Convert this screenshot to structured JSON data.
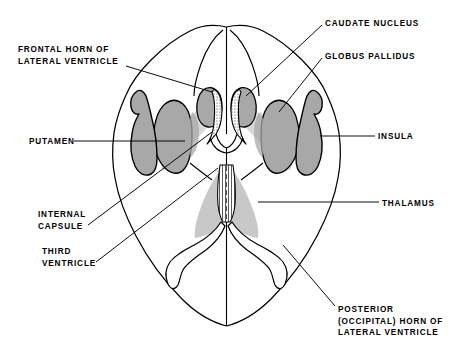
{
  "figure": {
    "type": "anatomical-diagram",
    "orientation": "anterior at top, posterior at bottom",
    "line_color": "#000000",
    "background_color": "#ffffff"
  },
  "labels": {
    "frontal_horn": "FRONTAL HORN OF\nLATERAL VENTRICLE",
    "caudate_nucleus": "CAUDATE NUCLEUS",
    "globus_pallidus": "GLOBUS PALLIDUS",
    "putamen": "PUTAMEN",
    "insula": "INSULA",
    "internal_capsule": "INTERNAL\nCAPSULE",
    "thalamus": "THALAMUS",
    "third_ventricle": "THIRD\nVENTRICLE",
    "posterior_horn": "POSTERIOR\n(OCCIPITAL) HORN OF\nLATERAL VENTRICLE"
  },
  "structures": [
    {
      "name": "cerebral-outline",
      "fill": "#ffffff",
      "stroke": "#000000"
    },
    {
      "name": "insula",
      "fill": "#a8a8a8",
      "stroke": "#000000"
    },
    {
      "name": "putamen",
      "fill": "#a8a8a8",
      "stroke": "#000000"
    },
    {
      "name": "caudate-nucleus",
      "fill": "#a8a8a8",
      "stroke": "#000000"
    },
    {
      "name": "globus-pallidus",
      "fill": "#a8a8a8",
      "stroke": "#000000"
    },
    {
      "name": "internal-capsule",
      "fill": "#d8d8d8",
      "stroke": "none"
    },
    {
      "name": "thalamus",
      "fill": "#c8c8c8",
      "stroke": "none"
    },
    {
      "name": "frontal-horn",
      "fill": "#ffffff",
      "stroke": "#000000",
      "texture": "stippled"
    },
    {
      "name": "third-ventricle",
      "fill": "#ffffff",
      "stroke": "#000000",
      "texture": "striped"
    },
    {
      "name": "posterior-horn",
      "fill": "#ffffff",
      "stroke": "#000000"
    }
  ],
  "colors": {
    "dark_gray": "#a8a8a8",
    "mid_gray": "#c8c8c8",
    "light_gray": "#d8d8d8",
    "outline": "#000000"
  }
}
